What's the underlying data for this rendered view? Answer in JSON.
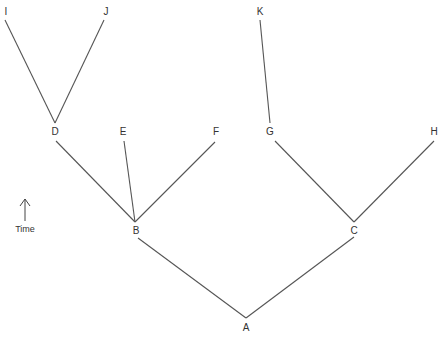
{
  "diagram": {
    "type": "phylogenetic-tree",
    "axis": {
      "label": "Time",
      "direction": "up"
    },
    "nodes": [
      {
        "id": "A",
        "label": "A",
        "x": 246,
        "y": 331,
        "vx": 246,
        "vy": 318
      },
      {
        "id": "B",
        "label": "B",
        "x": 136,
        "y": 234,
        "vx": 135,
        "vy": 222
      },
      {
        "id": "C",
        "label": "C",
        "x": 354,
        "y": 234,
        "vx": 354,
        "vy": 222
      },
      {
        "id": "D",
        "label": "D",
        "x": 55,
        "y": 135,
        "vx": 55,
        "vy": 123
      },
      {
        "id": "E",
        "label": "E",
        "x": 123,
        "y": 135
      },
      {
        "id": "F",
        "label": "F",
        "x": 216,
        "y": 135
      },
      {
        "id": "G",
        "label": "G",
        "x": 270,
        "y": 135
      },
      {
        "id": "H",
        "label": "H",
        "x": 434,
        "y": 135
      },
      {
        "id": "I",
        "label": "I",
        "x": 6,
        "y": 15
      },
      {
        "id": "J",
        "label": "J",
        "x": 106,
        "y": 15
      },
      {
        "id": "K",
        "label": "K",
        "x": 260,
        "y": 15
      }
    ],
    "edges": [
      {
        "from": "A",
        "to": "B",
        "x1": 246,
        "y1": 318,
        "x2": 138,
        "y2": 238
      },
      {
        "from": "A",
        "to": "C",
        "x1": 246,
        "y1": 318,
        "x2": 354,
        "y2": 237
      },
      {
        "from": "B",
        "to": "D",
        "x1": 135,
        "y1": 222,
        "x2": 56,
        "y2": 141
      },
      {
        "from": "B",
        "to": "E",
        "x1": 135,
        "y1": 222,
        "x2": 124,
        "y2": 141
      },
      {
        "from": "B",
        "to": "F",
        "x1": 135,
        "y1": 222,
        "x2": 215,
        "y2": 142
      },
      {
        "from": "C",
        "to": "G",
        "x1": 354,
        "y1": 222,
        "x2": 275,
        "y2": 141
      },
      {
        "from": "C",
        "to": "H",
        "x1": 354,
        "y1": 222,
        "x2": 434,
        "y2": 141
      },
      {
        "from": "D",
        "to": "I",
        "x1": 55,
        "y1": 123,
        "x2": 5,
        "y2": 20
      },
      {
        "from": "D",
        "to": "J",
        "x1": 55,
        "y1": 123,
        "x2": 104,
        "y2": 20
      },
      {
        "from": "G",
        "to": "K",
        "x1": 270,
        "y1": 123,
        "x2": 260,
        "y2": 20
      }
    ]
  }
}
